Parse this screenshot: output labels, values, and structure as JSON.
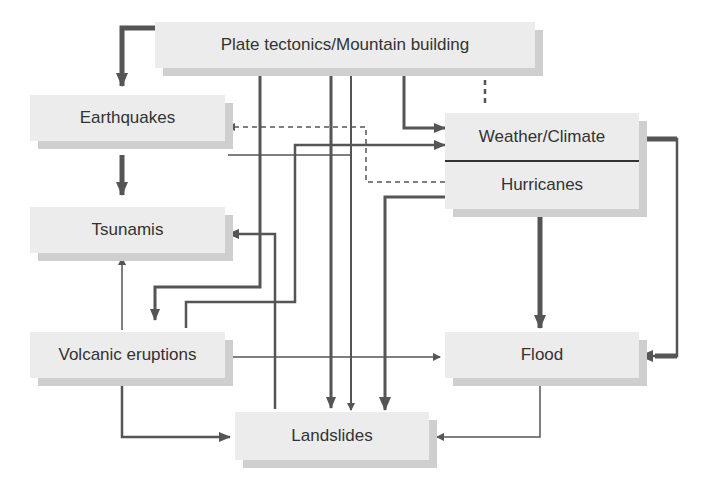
{
  "diagram": {
    "nodes": {
      "plate_tectonics": {
        "label": "Plate tectonics/Mountain building"
      },
      "earthquakes": {
        "label": "Earthquakes"
      },
      "tsunamis": {
        "label": "Tsunamis"
      },
      "volcanic": {
        "label": "Volcanic eruptions"
      },
      "weather": {
        "label": "Weather/Climate",
        "sub_label": "Hurricanes"
      },
      "flood": {
        "label": "Flood"
      },
      "landslides": {
        "label": "Landslides"
      }
    },
    "edges": [
      {
        "from": "Plate tectonics/Mountain building",
        "to": "Earthquakes",
        "style": "thick"
      },
      {
        "from": "Plate tectonics/Mountain building",
        "to": "Volcanic eruptions",
        "style": "thick"
      },
      {
        "from": "Plate tectonics/Mountain building",
        "to": "Landslides",
        "style": "thick"
      },
      {
        "from": "Plate tectonics/Mountain building",
        "to": "Weather/Climate",
        "style": "thick"
      },
      {
        "from": "Weather/Climate",
        "to": "Plate tectonics/Mountain building",
        "style": "dashed"
      },
      {
        "from": "Earthquakes",
        "to": "Tsunamis",
        "style": "thick"
      },
      {
        "from": "Earthquakes",
        "to": "Landslides",
        "style": "thin"
      },
      {
        "from": "Hurricanes",
        "to": "Earthquakes",
        "style": "dashed"
      },
      {
        "from": "Volcanic eruptions",
        "to": "Weather/Climate",
        "style": "medium"
      },
      {
        "from": "Volcanic eruptions",
        "to": "Tsunamis",
        "style": "thin"
      },
      {
        "from": "Volcanic eruptions",
        "to": "Flood",
        "style": "thin"
      },
      {
        "from": "Volcanic eruptions",
        "to": "Landslides",
        "style": "medium"
      },
      {
        "from": "Landslides",
        "to": "Tsunamis",
        "style": "medium"
      },
      {
        "from": "Hurricanes",
        "to": "Landslides",
        "style": "thick"
      },
      {
        "from": "Hurricanes",
        "to": "Flood",
        "style": "thick"
      },
      {
        "from": "Weather/Climate",
        "to": "Flood",
        "style": "thick"
      },
      {
        "from": "Flood",
        "to": "Landslides",
        "style": "thin"
      }
    ],
    "colors": {
      "box_fill": "#ececec",
      "box_shadow": "#cfcfcf",
      "line": "#555555",
      "text": "#333333"
    }
  }
}
